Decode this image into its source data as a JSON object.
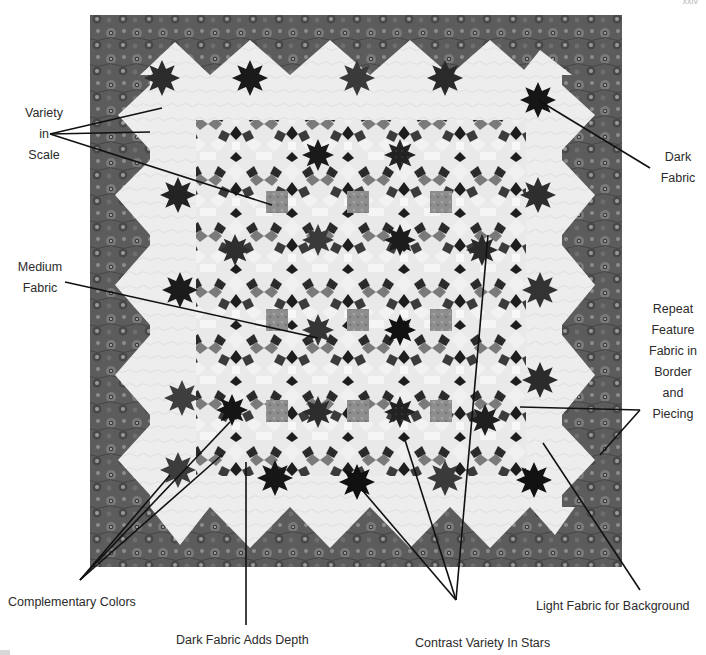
{
  "figure": {
    "page_number": "xxiv",
    "colors": {
      "border_fabric": "#5a5a5a",
      "light_fabric": "#ececec",
      "dark_fabric": "#1c1c1c",
      "medium_fabric": "#8a8a8a",
      "leader_line": "#111111",
      "label_text": "#2b2b2b"
    }
  },
  "labels": {
    "variety_in_scale": [
      "Variety",
      "in",
      "Scale"
    ],
    "dark_fabric": [
      "Dark",
      "Fabric"
    ],
    "medium_fabric": [
      "Medium",
      "Fabric"
    ],
    "repeat_feature": [
      "Repeat",
      "Feature",
      "Fabric in",
      "Border",
      "and",
      "Piecing"
    ],
    "complementary_colors": "Complementary Colors",
    "dark_fabric_adds_depth": "Dark Fabric Adds Depth",
    "contrast_variety": "Contrast Variety In Stars",
    "light_fabric_background": "Light Fabric for Background"
  }
}
